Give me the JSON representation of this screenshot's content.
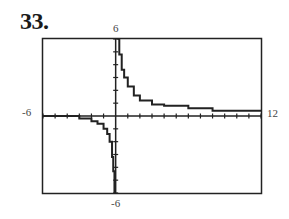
{
  "problem": {
    "number": "33."
  },
  "chart_data": {
    "type": "line",
    "title": "",
    "xlabel": "",
    "ylabel": "",
    "xlim": [
      -6,
      12
    ],
    "ylim": [
      -6,
      6
    ],
    "grid": false,
    "legend": null,
    "window_labels": {
      "xmin": "-6",
      "xmax": "12",
      "ymin": "-6",
      "ymax": "6"
    },
    "x_ticks_every": 1,
    "y_ticks_every": 1,
    "vertical_asymptote_x": 0.15,
    "horizontal_asymptote_y": 0.4,
    "series": [
      {
        "name": "left-branch",
        "x": [
          -6,
          -4,
          -3,
          -2,
          -1.5,
          -1,
          -0.7,
          -0.5,
          -0.3,
          -0.2,
          -0.1
        ],
        "y": [
          0.0,
          0.0,
          -0.2,
          -0.4,
          -0.6,
          -1.0,
          -1.4,
          -2.0,
          -3.2,
          -4.3,
          -6.0
        ]
      },
      {
        "name": "right-branch",
        "x": [
          0.15,
          0.3,
          0.5,
          0.7,
          1.0,
          1.5,
          2,
          3,
          4,
          6,
          8,
          10,
          12
        ],
        "y": [
          6.0,
          4.8,
          3.6,
          3.0,
          2.3,
          1.6,
          1.2,
          0.9,
          0.8,
          0.6,
          0.4,
          0.4,
          0.4
        ]
      }
    ]
  }
}
